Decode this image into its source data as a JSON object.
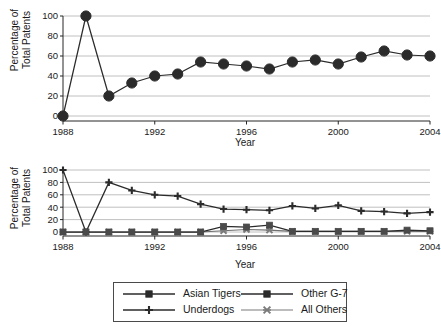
{
  "figure": {
    "background": "#ffffff",
    "line_color": "#2b2b2b",
    "grey_series_color": "#6f6f6f",
    "grid_color": "#b9b9b9"
  },
  "legend": {
    "entries": [
      {
        "label": "Asian Tigers",
        "marker": "filled-square",
        "color": "#2b2b2b"
      },
      {
        "label": "Other G-7",
        "marker": "filled-square",
        "color": "#2b2b2b"
      },
      {
        "label": "Underdogs",
        "marker": "plus",
        "color": "#2b2b2b"
      },
      {
        "label": "All Others",
        "marker": "x-cross",
        "color": "#7b7b7b"
      }
    ]
  },
  "chart_data": [
    {
      "id": "top",
      "type": "line",
      "title": "",
      "xlabel": "Year",
      "ylabel": "Percentage of Total Patents",
      "xlim": [
        1988,
        2004
      ],
      "ylim": [
        0,
        100
      ],
      "xticks": [
        1988,
        1992,
        1996,
        2000,
        2004
      ],
      "xtick_labels": [
        "1988",
        "1992",
        "1996",
        "2000",
        "2004"
      ],
      "yticks": [
        0,
        20,
        40,
        60,
        80,
        100
      ],
      "ytick_labels": [
        "0",
        "20",
        "40",
        "60",
        "80",
        "100"
      ],
      "grid": true,
      "legend_position": "none",
      "x": [
        1988,
        1989,
        1990,
        1991,
        1992,
        1993,
        1994,
        1995,
        1996,
        1997,
        1998,
        1999,
        2000,
        2001,
        2002,
        2003,
        2004
      ],
      "series": [
        {
          "name": "Other G-7",
          "marker": "filled-circle",
          "color": "#2b2b2b",
          "values": [
            0,
            100,
            20,
            33,
            40,
            42,
            54,
            52,
            50,
            47,
            54,
            56,
            52,
            59,
            65,
            61,
            60
          ]
        }
      ]
    },
    {
      "id": "bottom",
      "type": "line",
      "title": "",
      "xlabel": "Year",
      "ylabel": "Percentage of Total Patents",
      "xlim": [
        1988,
        2004
      ],
      "ylim": [
        0,
        100
      ],
      "xticks": [
        1988,
        1992,
        1996,
        2000,
        2004
      ],
      "xtick_labels": [
        "1988",
        "1992",
        "1996",
        "2000",
        "2004"
      ],
      "yticks": [
        0,
        20,
        40,
        60,
        80,
        100
      ],
      "ytick_labels": [
        "0",
        "20",
        "40",
        "60",
        "80",
        "100"
      ],
      "grid": true,
      "legend_position": "below",
      "x": [
        1988,
        1989,
        1990,
        1991,
        1992,
        1993,
        1994,
        1995,
        1996,
        1997,
        1998,
        1999,
        2000,
        2001,
        2002,
        2003,
        2004
      ],
      "series": [
        {
          "name": "Underdogs",
          "marker": "plus",
          "color": "#2b2b2b",
          "values": [
            100,
            0,
            80,
            67,
            60,
            58,
            45,
            37,
            36,
            35,
            42,
            38,
            43,
            34,
            33,
            30,
            32
          ]
        },
        {
          "name": "Asian Tigers",
          "marker": "filled-square",
          "color": "#4a4a4a",
          "values": [
            0,
            0,
            0,
            0,
            0,
            0,
            0,
            9,
            8,
            11,
            1,
            1,
            1,
            1,
            1,
            3,
            2
          ]
        },
        {
          "name": "All Others",
          "marker": "x-cross",
          "color": "#7b7b7b",
          "values": [
            0,
            0,
            0,
            0,
            0,
            0,
            0,
            2,
            4,
            3,
            1,
            1,
            1,
            1,
            1,
            1,
            1
          ]
        }
      ]
    }
  ]
}
